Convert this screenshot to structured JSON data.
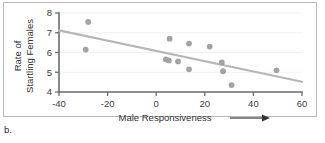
{
  "panel": {
    "label": "b."
  },
  "chart_data": {
    "type": "scatter",
    "title": "",
    "xlabel": "Male Responsiveness",
    "ylabel_line1": "Rate of",
    "ylabel_line2": "Startling Females",
    "xlabel_has_arrow": true,
    "xlim": [
      -40,
      60
    ],
    "ylim": [
      4,
      8
    ],
    "xticks": [
      -40,
      -20,
      0,
      20,
      40,
      60
    ],
    "xtick_labels": [
      "-40",
      "-20",
      "0",
      "20",
      "40",
      "60"
    ],
    "yticks": [
      4,
      5,
      6,
      7,
      8
    ],
    "ytick_labels": [
      "4",
      "5",
      "6",
      "7",
      "8"
    ],
    "grid": true,
    "legend": null,
    "point_color": "#a3a3a3",
    "trend_color": "#b6b6b6",
    "points": [
      {
        "x": -28.0,
        "y": 7.55
      },
      {
        "x": -29.0,
        "y": 6.15
      },
      {
        "x": 5.5,
        "y": 6.7
      },
      {
        "x": 4.0,
        "y": 5.65
      },
      {
        "x": 5.2,
        "y": 5.6
      },
      {
        "x": 9.0,
        "y": 5.55
      },
      {
        "x": 13.5,
        "y": 6.45
      },
      {
        "x": 13.5,
        "y": 5.15
      },
      {
        "x": 22.0,
        "y": 6.3
      },
      {
        "x": 27.0,
        "y": 5.5
      },
      {
        "x": 27.5,
        "y": 5.05
      },
      {
        "x": 31.0,
        "y": 4.35
      },
      {
        "x": 49.5,
        "y": 5.1
      }
    ],
    "trend_line": {
      "x_start": -40,
      "y_start": 7.12,
      "x_end": 60,
      "y_end": 4.52
    }
  }
}
